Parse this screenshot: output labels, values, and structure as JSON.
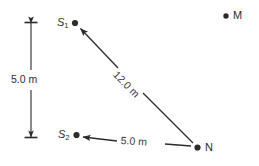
{
  "figure": {
    "background_color": "#ffffff",
    "ink_color": "#2b2b2b",
    "points": {
      "s1": {
        "label_main": "S",
        "label_sub": "1",
        "x": 75,
        "y": 23
      },
      "s2": {
        "label_main": "S",
        "label_sub": "2",
        "x": 76,
        "y": 135
      },
      "n": {
        "label": "N",
        "x": 197,
        "y": 147
      },
      "m": {
        "label": "M",
        "x": 226,
        "y": 16
      }
    },
    "measurements": {
      "vertical_scale": "5.0 m",
      "diagonal": "12.0 m",
      "horizontal": "5.0 m"
    }
  }
}
